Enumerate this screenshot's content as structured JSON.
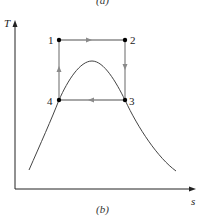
{
  "figure": {
    "top_caption": "(a)",
    "bottom_caption": "(b)",
    "y_axis_label": "T",
    "x_axis_label": "s",
    "points": [
      {
        "id": "1",
        "x": 59,
        "y": 40
      },
      {
        "id": "2",
        "x": 125,
        "y": 40
      },
      {
        "id": "3",
        "x": 125,
        "y": 100
      },
      {
        "id": "4",
        "x": 59,
        "y": 100
      }
    ],
    "process_direction": [
      "1→2",
      "2→3",
      "3→4",
      "4→1"
    ],
    "colors": {
      "cycle": "#888888",
      "curve": "#444444",
      "axis": "#222222",
      "points": "#000000"
    }
  }
}
